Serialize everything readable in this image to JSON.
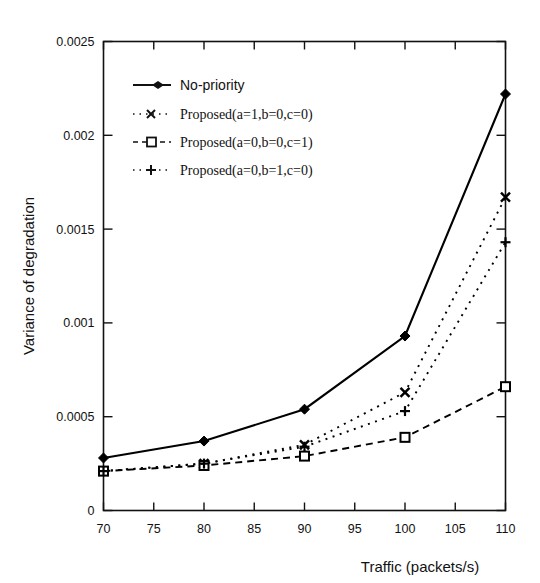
{
  "chart_data": {
    "type": "line",
    "title": "",
    "xlabel": "Traffic (packets/s)",
    "ylabel": "Variance of degradation",
    "x": [
      70,
      80,
      90,
      100,
      110
    ],
    "xlim": [
      70,
      110
    ],
    "ylim": [
      0,
      0.0025
    ],
    "xticks": [
      "70",
      "75",
      "80",
      "85",
      "90",
      "95",
      "100",
      "105",
      "110"
    ],
    "xtick_values": [
      70,
      75,
      80,
      85,
      90,
      95,
      100,
      105,
      110
    ],
    "yticks": [
      "0",
      "0.0005",
      "0.001",
      "0.0015",
      "0.002",
      "0.0025"
    ],
    "ytick_values": [
      0,
      0.0005,
      0.001,
      0.0015,
      0.002,
      0.0025
    ],
    "grid": false,
    "legend_position": "upper-left-inside",
    "series": [
      {
        "name": "No-priority",
        "marker": "filled-diamond",
        "line": "solid",
        "color": "#000000",
        "values": [
          0.00028,
          0.00037,
          0.00054,
          0.00093,
          0.00222
        ]
      },
      {
        "name": "Proposed(a=1,b=0,c=0)",
        "marker": "cross-x",
        "line": "dotted",
        "color": "#000000",
        "values": [
          0.00021,
          0.00025,
          0.00035,
          0.00063,
          0.00167
        ]
      },
      {
        "name": "Proposed(a=0,b=0,c=1)",
        "marker": "open-square",
        "line": "dashed",
        "color": "#000000",
        "values": [
          0.00021,
          0.00024,
          0.00029,
          0.00039,
          0.00066
        ]
      },
      {
        "name": "Proposed(a=0,b=1,c=0)",
        "marker": "plus",
        "line": "dotted",
        "color": "#000000",
        "values": [
          0.00021,
          0.00025,
          0.00034,
          0.00053,
          0.00143
        ]
      }
    ]
  },
  "legend": {
    "items": [
      {
        "label": "No-priority"
      },
      {
        "label": "Proposed(a=1,b=0,c=0)"
      },
      {
        "label": "Proposed(a=0,b=0,c=1)"
      },
      {
        "label": "Proposed(a=0,b=1,c=0)"
      }
    ]
  }
}
